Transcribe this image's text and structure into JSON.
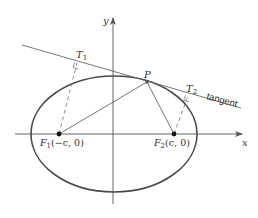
{
  "figure": {
    "type": "ellipse-reflection-property",
    "colors": {
      "stroke": "#555555",
      "ellipse": "#4a4a4a",
      "text": "#333333",
      "background": "#ffffff"
    },
    "axes": {
      "x_label": "x",
      "y_label": "y"
    },
    "labels": {
      "f1": "F",
      "f1_sub": "1",
      "f1_coords": "(−c, 0)",
      "f2": "F",
      "f2_sub": "2",
      "f2_coords": "(c, 0)",
      "p": "P",
      "t1": "T",
      "t1_sub": "1",
      "t2": "T",
      "t2_sub": "2",
      "tangent": "tangent"
    }
  }
}
